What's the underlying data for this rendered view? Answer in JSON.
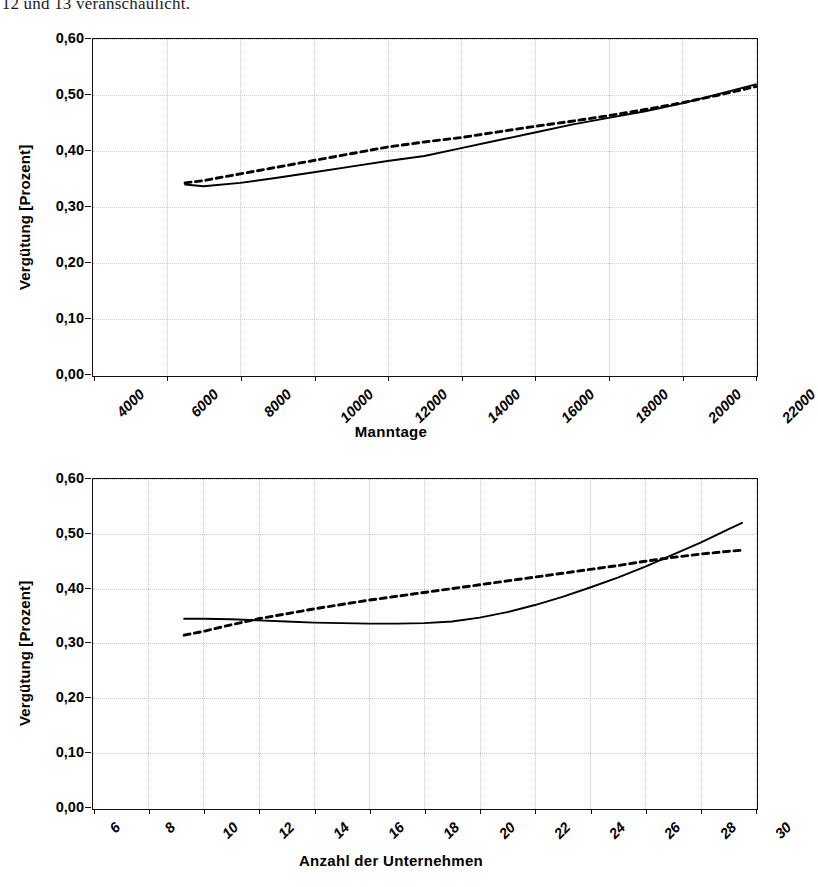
{
  "document": {
    "body_text_line": "mmen 12 und 13 veranschaulicht."
  },
  "charts": [
    {
      "id": "chart-manntage",
      "ylabel": "Vergütung [Prozent]",
      "xlabel": "Manntage",
      "yticks": [
        "0,60",
        "0,50",
        "0,40",
        "0,30",
        "0,20",
        "0,10",
        "0,00"
      ],
      "xticks": [
        "4000",
        "6000",
        "8000",
        "10000",
        "12000",
        "14000",
        "16000",
        "18000",
        "20000",
        "22000"
      ]
    },
    {
      "id": "chart-unternehmen",
      "ylabel": "Vergütung [Prozent]",
      "xlabel": "Anzahl der Unternehmen",
      "yticks": [
        "0,60",
        "0,50",
        "0,40",
        "0,30",
        "0,20",
        "0,10",
        "0,00"
      ],
      "xticks": [
        "6",
        "8",
        "10",
        "12",
        "14",
        "16",
        "18",
        "20",
        "22",
        "24",
        "26",
        "28",
        "30"
      ]
    }
  ],
  "chart_data": [
    {
      "type": "line",
      "title": "",
      "xlabel": "Manntage",
      "ylabel": "Vergütung [Prozent]",
      "xlim": [
        4000,
        22000
      ],
      "ylim": [
        0.0,
        0.6
      ],
      "xticks": [
        4000,
        6000,
        8000,
        10000,
        12000,
        14000,
        16000,
        18000,
        20000,
        22000
      ],
      "yticks": [
        0.0,
        0.1,
        0.2,
        0.3,
        0.4,
        0.5,
        0.6
      ],
      "grid": true,
      "legend": "none",
      "series": [
        {
          "name": "solid-line",
          "style": "solid",
          "color": "#000000",
          "x": [
            6500,
            7000,
            8000,
            9000,
            10000,
            11000,
            12000,
            13000,
            14000,
            15000,
            16000,
            17000,
            18000,
            19000,
            20000,
            21000,
            22000
          ],
          "y": [
            0.34,
            0.337,
            0.343,
            0.352,
            0.362,
            0.372,
            0.382,
            0.391,
            0.405,
            0.419,
            0.433,
            0.447,
            0.459,
            0.471,
            0.485,
            0.502,
            0.519
          ]
        },
        {
          "name": "dotted-line",
          "style": "dotted",
          "color": "#000000",
          "x": [
            6500,
            7000,
            8000,
            9000,
            10000,
            11000,
            12000,
            13000,
            14000,
            15000,
            16000,
            17000,
            18000,
            19000,
            20000,
            21000,
            22000
          ],
          "y": [
            0.343,
            0.347,
            0.359,
            0.371,
            0.383,
            0.395,
            0.407,
            0.416,
            0.424,
            0.434,
            0.444,
            0.453,
            0.463,
            0.474,
            0.486,
            0.5,
            0.515
          ]
        }
      ]
    },
    {
      "type": "line",
      "title": "",
      "xlabel": "Anzahl der Unternehmen",
      "ylabel": "Vergütung [Prozent]",
      "xlim": [
        6,
        30
      ],
      "ylim": [
        0.0,
        0.6
      ],
      "xticks": [
        6,
        8,
        10,
        12,
        14,
        16,
        18,
        20,
        22,
        24,
        26,
        28,
        30
      ],
      "yticks": [
        0.0,
        0.1,
        0.2,
        0.3,
        0.4,
        0.5,
        0.6
      ],
      "grid": true,
      "legend": "none",
      "series": [
        {
          "name": "solid-line",
          "style": "solid",
          "color": "#000000",
          "x": [
            9.3,
            10,
            11,
            12,
            13,
            14,
            15,
            16,
            17,
            18,
            19,
            20,
            21,
            22,
            23,
            24,
            25,
            26,
            27,
            28,
            29,
            29.5
          ],
          "y": [
            0.345,
            0.345,
            0.344,
            0.342,
            0.34,
            0.338,
            0.337,
            0.336,
            0.336,
            0.337,
            0.34,
            0.347,
            0.357,
            0.37,
            0.385,
            0.402,
            0.42,
            0.44,
            0.462,
            0.484,
            0.508,
            0.52
          ]
        },
        {
          "name": "dotted-line",
          "style": "dotted",
          "color": "#000000",
          "x": [
            9.3,
            10,
            11,
            12,
            13,
            14,
            15,
            16,
            17,
            18,
            19,
            20,
            21,
            22,
            23,
            24,
            25,
            26,
            27,
            28,
            29,
            29.5
          ],
          "y": [
            0.315,
            0.322,
            0.334,
            0.345,
            0.354,
            0.363,
            0.371,
            0.379,
            0.386,
            0.393,
            0.4,
            0.407,
            0.414,
            0.421,
            0.428,
            0.435,
            0.442,
            0.45,
            0.457,
            0.463,
            0.468,
            0.47
          ]
        }
      ]
    }
  ]
}
